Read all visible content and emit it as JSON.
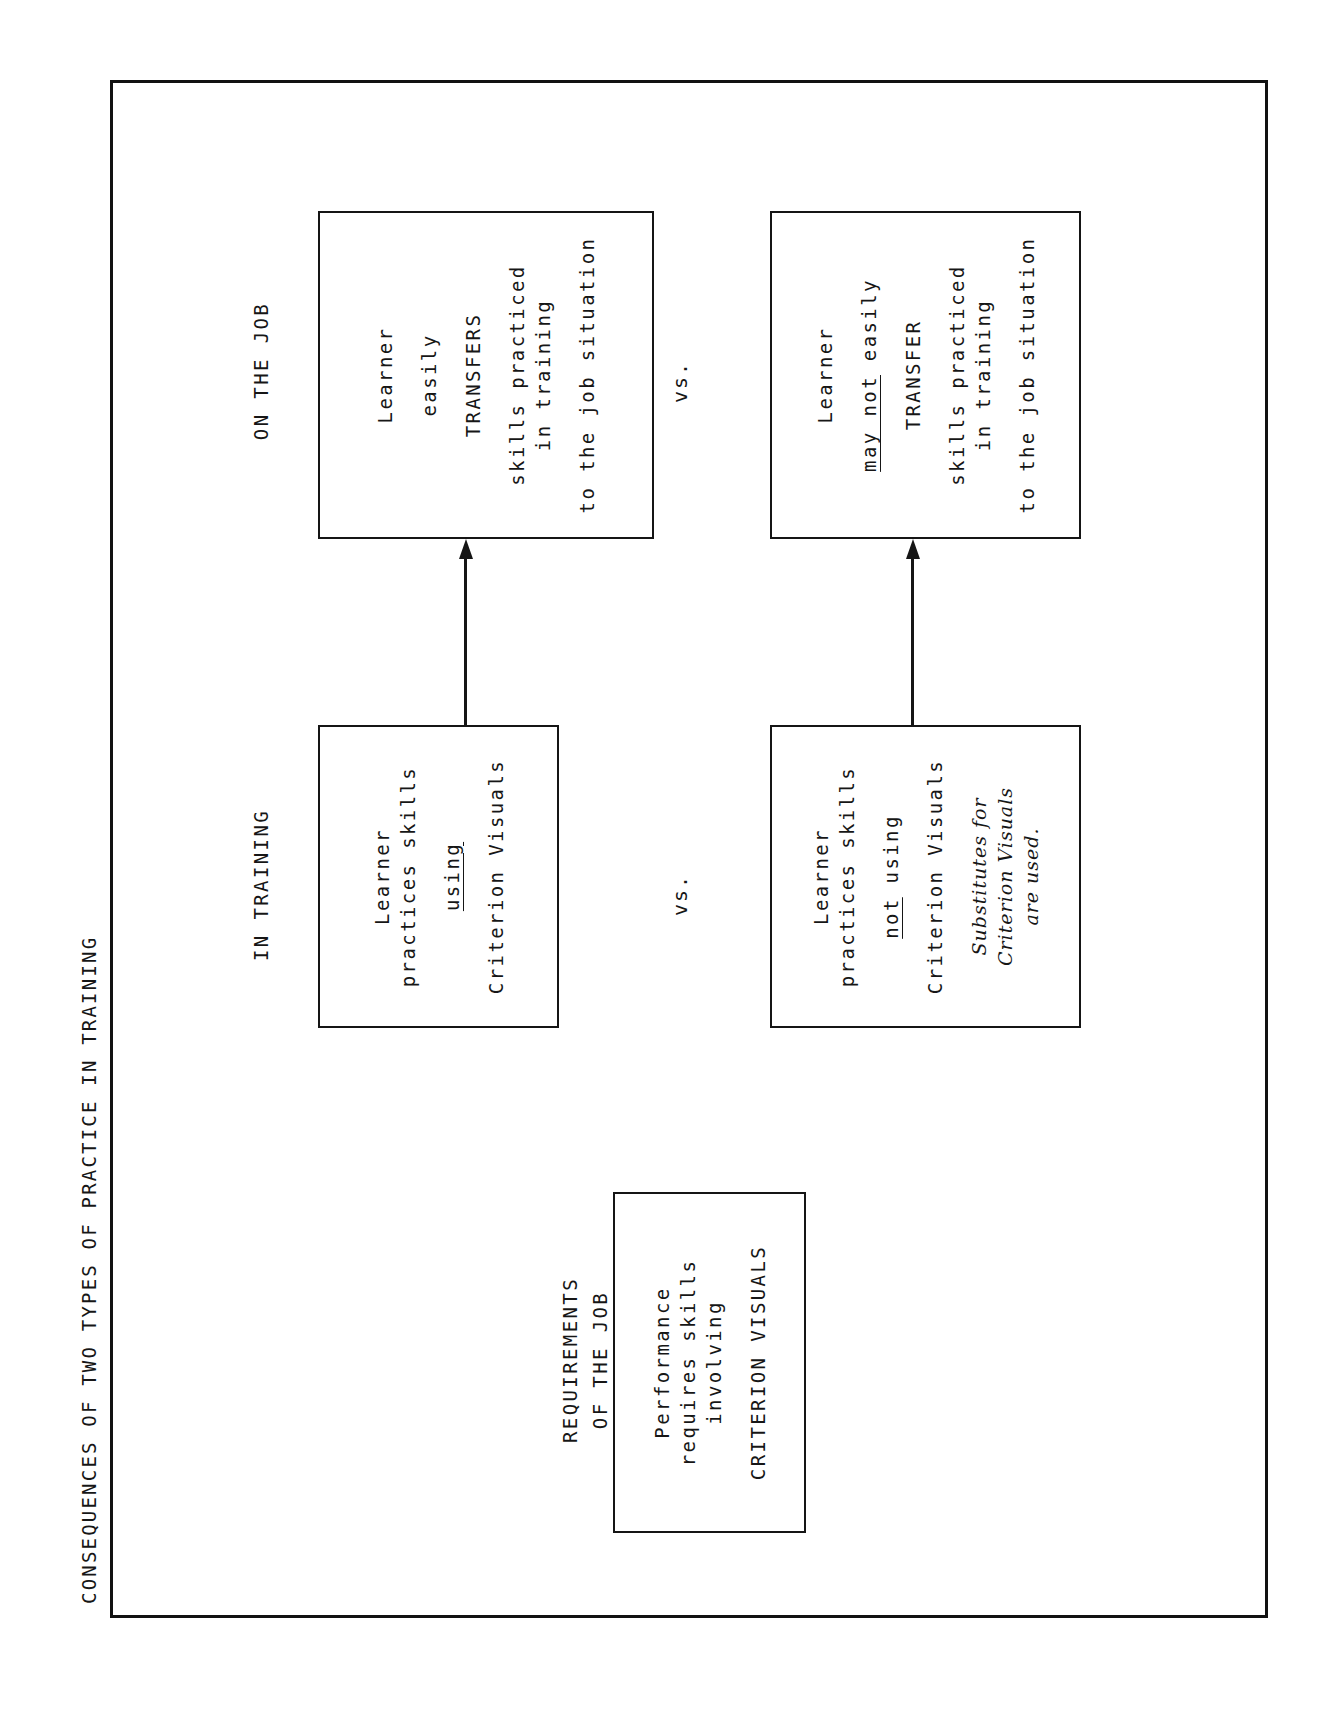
{
  "title": "CONSEQUENCES OF TWO TYPES OF PRACTICE IN TRAINING",
  "requirements": {
    "heading_lines": [
      "REQUIREMENTS",
      "OF THE JOB"
    ],
    "box_lines": [
      "Performance",
      "requires skills",
      "involving",
      "CRITERION VISUALS"
    ]
  },
  "columns": {
    "training_heading": "IN TRAINING",
    "job_heading": "ON THE JOB"
  },
  "separator": "vs.",
  "scenario_good": {
    "training_lines": {
      "l1": "Learner",
      "l2": "practices skills",
      "l3": "using",
      "l4": "Criterion Visuals"
    },
    "job_lines": {
      "l1": "Learner",
      "l2": "easily",
      "l3": "TRANSFERS",
      "l4": "skills practiced",
      "l5": "in training",
      "l6": "to the job situation"
    }
  },
  "scenario_poor": {
    "training_lines": {
      "l1": "Learner",
      "l2": "practices skills",
      "l3a": "not",
      "l3b": " using",
      "l4": "Criterion Visuals",
      "note1": "Substitutes for",
      "note2": "Criterion Visuals",
      "note3": "are used."
    },
    "job_lines": {
      "l1": "Learner",
      "l2a": "may not",
      "l2b": " easily",
      "l3": "TRANSFER",
      "l4": "skills practiced",
      "l5": "in training",
      "l6": "to the job situation"
    }
  },
  "colors": {
    "ink": "#151515",
    "paper": "#ffffff"
  }
}
